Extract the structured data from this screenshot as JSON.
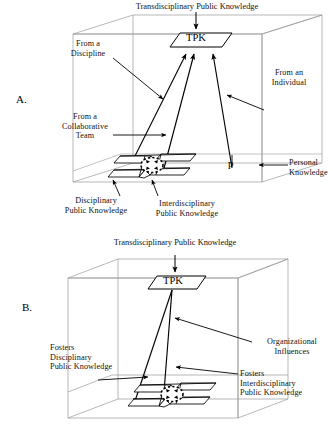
{
  "figure": {
    "background_color": "#ffffff",
    "line_color": "#000000",
    "faint_line_color": "#9a9a9a",
    "panels": [
      {
        "letter": "A.",
        "title": "Transdisciplinary Public Knowledge",
        "node_label": "TPK",
        "personal_knowledge_symbol": "p",
        "labels": {
          "from_discipline": "From a\nDiscipline",
          "from_collaborative_team": "From a\nCollaborative\nTeam",
          "from_individual": "From an\nIndividual",
          "personal_knowledge": "Personal\nKnowledge",
          "disciplinary_public_knowledge": "Disciplinary\nPublic Knowledge",
          "interdisciplinary_public_knowledge": "Interdisciplinary\nPublic Knowledge"
        }
      },
      {
        "letter": "B.",
        "title": "Transdisciplinary Public Knowledge",
        "node_label": "TPK",
        "labels": {
          "fosters_disciplinary": "Fosters\nDisciplinary\nPublic Knowledge",
          "organizational_influences": "Organizational\nInfluences",
          "fosters_interdisciplinary": "Fosters\nInterdisciplinary\nPublic Knowledge"
        }
      }
    ]
  }
}
